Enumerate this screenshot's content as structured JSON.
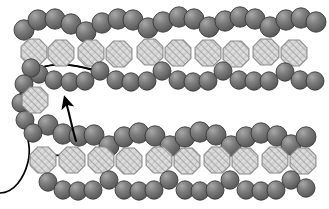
{
  "figure": {
    "canvas": {
      "width": 329,
      "height": 209,
      "background": "#ffffff"
    },
    "annotation_arrow": {
      "name": "fold-direction-arrow",
      "label": "",
      "color": "#000000",
      "tail_start": [
        72,
        140
      ],
      "tip": [
        64,
        88
      ]
    },
    "backbone_line": {
      "name": "backbone-chain-line",
      "color": "#000000",
      "width": 1.6
    }
  },
  "legend": {
    "sphere": {
      "name": "dark-sphere-bead",
      "fill": "#6b6b6b",
      "highlight": "#9d9d9d",
      "stroke": "#3a3a3a"
    },
    "octagon": {
      "name": "hatched-octagon-unit",
      "fill": "#d9d9d9",
      "hatch": "#9a9a9a",
      "stroke": "#8a8a8a"
    }
  },
  "chart_data": {
    "type": "scatter",
    "xlabel": "",
    "ylabel": "",
    "xlim": [
      0,
      329
    ],
    "ylim": [
      0,
      209
    ],
    "grid": false,
    "legend_position": "none",
    "series": [
      {
        "name": "top-outer-sphere-row",
        "marker": "sphere",
        "r": 10,
        "points": [
          [
            24,
            30
          ],
          [
            38,
            20
          ],
          [
            55,
            19
          ],
          [
            71,
            24
          ],
          [
            86,
            32
          ],
          [
            102,
            23
          ],
          [
            118,
            19
          ],
          [
            133,
            20
          ],
          [
            148,
            28
          ],
          [
            163,
            22
          ],
          [
            179,
            17
          ],
          [
            194,
            19
          ],
          [
            209,
            27
          ],
          [
            225,
            21
          ],
          [
            240,
            17
          ],
          [
            255,
            19
          ],
          [
            270,
            27
          ],
          [
            286,
            20
          ],
          [
            301,
            18
          ],
          [
            316,
            22
          ]
        ]
      },
      {
        "name": "top-inner-sphere-row",
        "marker": "sphere",
        "r": 9,
        "points": [
          [
            39,
            74
          ],
          [
            54,
            80
          ],
          [
            70,
            82
          ],
          [
            85,
            81
          ],
          [
            100,
            71
          ],
          [
            116,
            80
          ],
          [
            131,
            82
          ],
          [
            147,
            81
          ],
          [
            162,
            71
          ],
          [
            178,
            80
          ],
          [
            193,
            82
          ],
          [
            208,
            81
          ],
          [
            223,
            71
          ],
          [
            239,
            80
          ],
          [
            254,
            81
          ],
          [
            269,
            81
          ],
          [
            285,
            72
          ],
          [
            300,
            80
          ],
          [
            315,
            81
          ]
        ]
      },
      {
        "name": "top-octagon-row",
        "marker": "octagon",
        "r": 14,
        "points": [
          [
            34,
            52
          ],
          [
            61,
            53
          ],
          [
            91,
            53
          ],
          [
            119,
            54
          ],
          [
            150,
            52
          ],
          [
            178,
            53
          ],
          [
            208,
            53
          ],
          [
            236,
            54
          ],
          [
            266,
            52
          ],
          [
            294,
            53
          ]
        ]
      },
      {
        "name": "bottom-outer-sphere-row",
        "marker": "sphere",
        "r": 10,
        "points": [
          [
            48,
            125
          ],
          [
            63,
            134
          ],
          [
            79,
            136
          ],
          [
            94,
            135
          ],
          [
            109,
            146
          ],
          [
            124,
            137
          ],
          [
            139,
            133
          ],
          [
            155,
            136
          ],
          [
            170,
            146
          ],
          [
            185,
            137
          ],
          [
            200,
            132
          ],
          [
            216,
            135
          ],
          [
            231,
            146
          ],
          [
            246,
            137
          ],
          [
            261,
            133
          ],
          [
            277,
            136
          ],
          [
            291,
            145
          ],
          [
            306,
            137
          ]
        ]
      },
      {
        "name": "bottom-inner-sphere-row",
        "marker": "sphere",
        "r": 9,
        "points": [
          [
            48,
            182
          ],
          [
            63,
            190
          ],
          [
            78,
            191
          ],
          [
            93,
            190
          ],
          [
            109,
            180
          ],
          [
            124,
            190
          ],
          [
            139,
            191
          ],
          [
            154,
            190
          ],
          [
            169,
            180
          ],
          [
            185,
            190
          ],
          [
            200,
            191
          ],
          [
            215,
            190
          ],
          [
            230,
            180
          ],
          [
            246,
            190
          ],
          [
            261,
            191
          ],
          [
            276,
            190
          ],
          [
            291,
            180
          ],
          [
            306,
            188
          ]
        ]
      },
      {
        "name": "bottom-octagon-row",
        "marker": "octagon",
        "r": 14,
        "points": [
          [
            43,
            160
          ],
          [
            72,
            160
          ],
          [
            101,
            160
          ],
          [
            129,
            161
          ],
          [
            159,
            160
          ],
          [
            187,
            161
          ],
          [
            217,
            160
          ],
          [
            245,
            161
          ],
          [
            275,
            160
          ],
          [
            303,
            161
          ]
        ]
      },
      {
        "name": "hairpin-turn-spheres",
        "marker": "sphere",
        "r": 9,
        "points": [
          [
            31,
            68
          ],
          [
            24,
            84
          ],
          [
            21,
            103
          ],
          [
            25,
            120
          ],
          [
            33,
            133
          ]
        ]
      },
      {
        "name": "hairpin-turn-octagon",
        "marker": "octagon",
        "r": 14,
        "points": [
          [
            35,
            100
          ]
        ]
      }
    ]
  }
}
